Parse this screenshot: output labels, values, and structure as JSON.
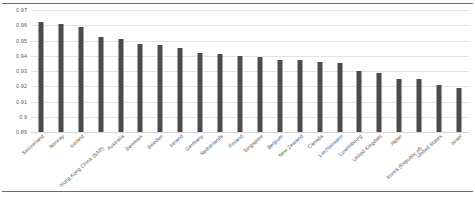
{
  "chart_data": {
    "type": "bar",
    "title": "",
    "subtitle": "",
    "xlabel": "",
    "ylabel": "",
    "ylim": [
      0.89,
      0.97
    ],
    "grid": true,
    "legend": false,
    "bar_color": "#4c4c4c",
    "gridline_color": "#e2e2e2",
    "yticks": [
      "0.97",
      "0.96",
      "0.95",
      "0.94",
      "0.93",
      "0.92",
      "0.91",
      "0.9",
      "0.89"
    ],
    "ytick_values": [
      0.97,
      0.96,
      0.95,
      0.94,
      0.93,
      0.92,
      0.91,
      0.9,
      0.89
    ],
    "categories": [
      "Switzerland",
      "Norway",
      "Iceland",
      "Hong Kong China (SAR)",
      "Australia",
      "Denmark",
      "Sweden",
      "Ireland",
      "Germany",
      "Netherlands",
      "Finland",
      "Singapore",
      "Belgium",
      "New Zealand",
      "Canada",
      "Liechtenstein",
      "Luxembourg",
      "United Kingdom",
      "Japan",
      "Korea (Republic of)",
      "United States",
      "Israel"
    ],
    "values": [
      0.962,
      0.961,
      0.959,
      0.952,
      0.951,
      0.948,
      0.947,
      0.945,
      0.942,
      0.941,
      0.94,
      0.939,
      0.937,
      0.937,
      0.936,
      0.935,
      0.93,
      0.929,
      0.925,
      0.925,
      0.921,
      0.919
    ],
    "series": [
      {
        "name": "Human Development Index",
        "values": [
          0.962,
          0.961,
          0.959,
          0.952,
          0.951,
          0.948,
          0.947,
          0.945,
          0.942,
          0.941,
          0.94,
          0.939,
          0.937,
          0.937,
          0.936,
          0.935,
          0.93,
          0.929,
          0.925,
          0.925,
          0.921,
          0.919
        ]
      }
    ]
  }
}
